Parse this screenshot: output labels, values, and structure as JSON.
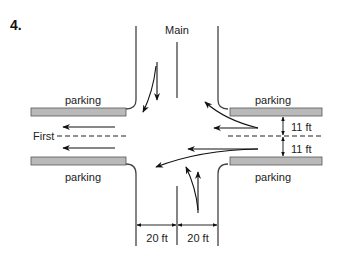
{
  "problem": {
    "number": "4."
  },
  "streets": {
    "main": {
      "label": "Main"
    },
    "first": {
      "label": "First"
    }
  },
  "parking": {
    "upper_left": "parking",
    "upper_right": "parking",
    "lower_left": "parking",
    "lower_right": "parking"
  },
  "dimensions": {
    "lane_width_upper": "11 ft",
    "lane_width_lower": "11 ft",
    "approach_width_left": "20 ft",
    "approach_width_right": "20 ft"
  },
  "colors": {
    "parking_fill": "#b9b9b9",
    "line": "#222222",
    "background": "#ffffff"
  }
}
